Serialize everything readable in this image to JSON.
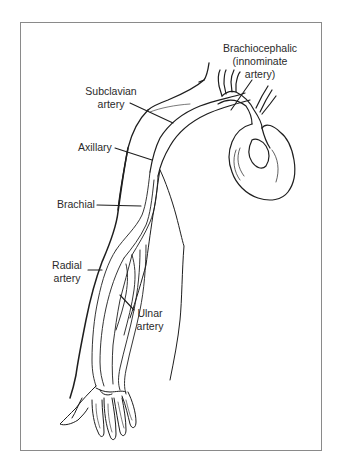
{
  "diagram": {
    "labels": [
      {
        "id": "brachiocephalic",
        "lines": [
          "Brachiocephalic",
          "(innominate",
          "artery)"
        ]
      },
      {
        "id": "subclavian",
        "lines": [
          "Subclavian",
          "artery"
        ]
      },
      {
        "id": "axillary",
        "lines": [
          "Axillary"
        ]
      },
      {
        "id": "brachial",
        "lines": [
          "Brachial"
        ]
      },
      {
        "id": "radial",
        "lines": [
          "Radial",
          "artery"
        ]
      },
      {
        "id": "ulnar",
        "lines": [
          "Ulnar",
          "artery"
        ]
      }
    ],
    "colors": {
      "line": "#1e1e1e",
      "text": "#2a2a2a",
      "frame": "#8a8a8a",
      "background": "#ffffff"
    }
  }
}
